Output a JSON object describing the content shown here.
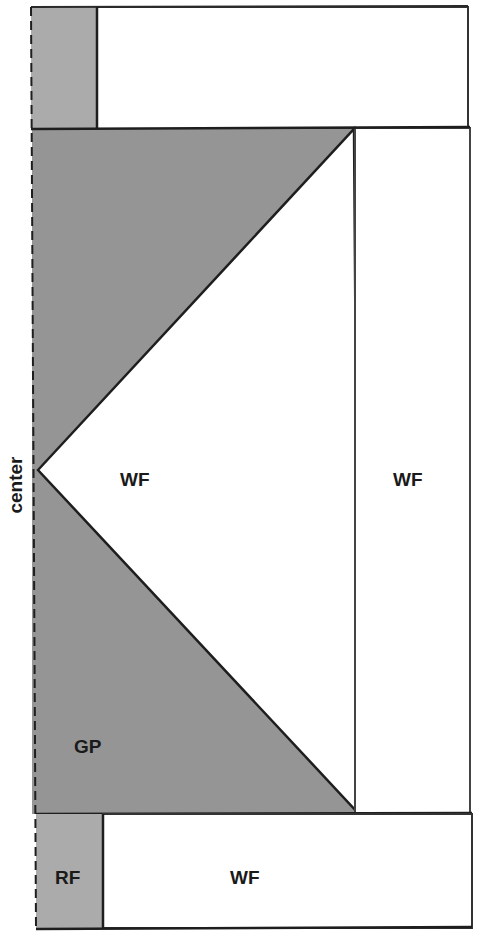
{
  "diagram": {
    "axis_label": "center",
    "regions": {
      "top_gray": "",
      "top_white": "",
      "ground_plate": "GP",
      "inner_wedge": "WF",
      "right_panel": "WF",
      "bottom_gray": "RF",
      "bottom_white": "WF"
    },
    "colors": {
      "gray_fill": "#a8a8a8",
      "dark_gray_fill": "#8f8f8f",
      "white_fill": "#ffffff",
      "stroke": "#1e1e1e"
    }
  }
}
